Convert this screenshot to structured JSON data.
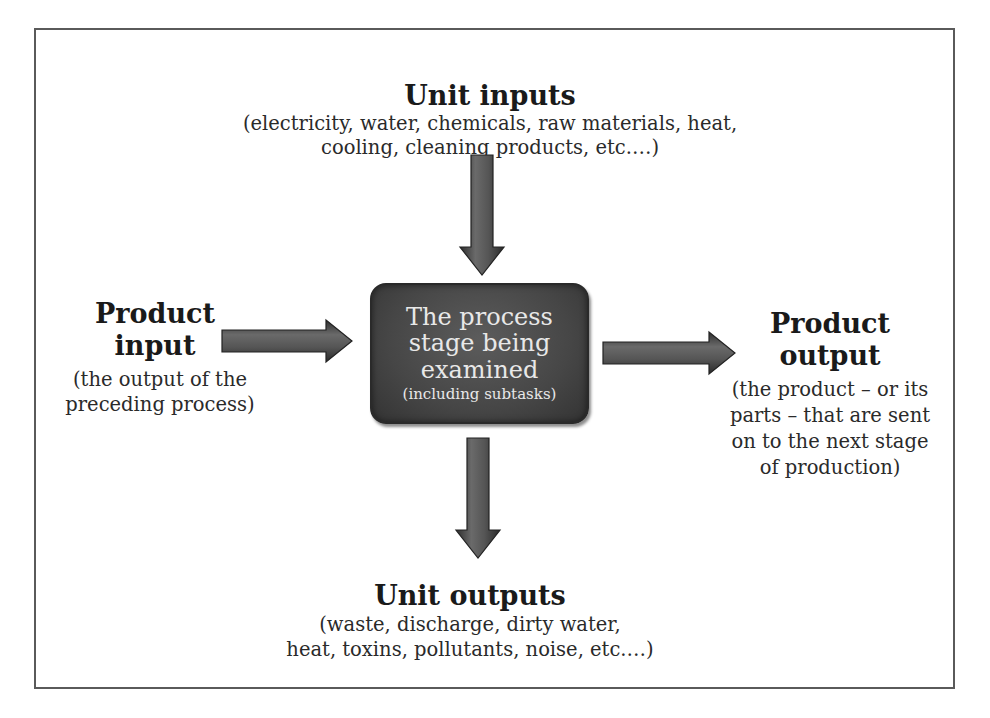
{
  "diagram": {
    "center": {
      "line1": "The process",
      "line2": "stage being",
      "line3": "examined",
      "subtext": "(including subtasks)"
    },
    "unit_inputs": {
      "title": "Unit inputs",
      "desc_line1": "(electricity, water, chemicals, raw materials, heat,",
      "desc_line2": "cooling, cleaning products, etc.…)"
    },
    "product_input": {
      "title_line1": "Product",
      "title_line2": "input",
      "desc_line1": "(the output of the",
      "desc_line2": "preceding process)"
    },
    "product_output": {
      "title_line1": "Product",
      "title_line2": "output",
      "desc_line1": "(the product – or its",
      "desc_line2": "parts – that are sent",
      "desc_line3": "on to the next stage",
      "desc_line4": "of production)"
    },
    "unit_outputs": {
      "title": "Unit outputs",
      "desc_line1": "(waste, discharge, dirty water,",
      "desc_line2": "heat, toxins, pollutants, noise, etc.…)"
    },
    "arrows": [
      {
        "name": "unit-inputs-arrow",
        "direction": "down",
        "from": "unit_inputs",
        "to": "center"
      },
      {
        "name": "product-input-arrow",
        "direction": "right",
        "from": "product_input",
        "to": "center"
      },
      {
        "name": "product-output-arrow",
        "direction": "right",
        "from": "center",
        "to": "product_output"
      },
      {
        "name": "unit-outputs-arrow",
        "direction": "down",
        "from": "center",
        "to": "unit_outputs"
      }
    ],
    "colors": {
      "box_fill": "#464646",
      "box_text": "#e8e8e8",
      "arrow_fill": "#4a4a4a",
      "frame": "#5a5a5a",
      "text": "#1e1e1e"
    }
  }
}
